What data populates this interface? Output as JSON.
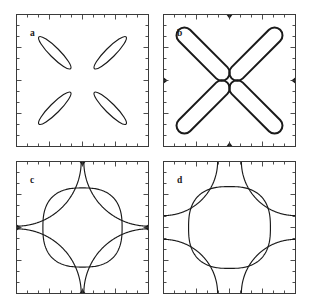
{
  "figure": {
    "background": "#ffffff",
    "line_color": "#1a1a1a",
    "frame_color": "#3a3a3a",
    "layout": "2x2 grid of square panels"
  },
  "panels": [
    {
      "id": "a",
      "label": "a",
      "position": "top-left",
      "x": 16,
      "y": 14,
      "size": 133,
      "description": "four thin elongated elliptical pockets arranged with four-fold symmetry",
      "feature_count": 4,
      "has_cusps": false
    },
    {
      "id": "b",
      "label": "b",
      "position": "top-right",
      "x": 163,
      "y": 14,
      "size": 133,
      "description": "four large rounded stadium contours forming a diamond, nearly touching at the vertices with thickened dark ends",
      "feature_count": 4,
      "has_cusps": true
    },
    {
      "id": "c",
      "label": "c",
      "position": "bottom-left",
      "x": 16,
      "y": 161,
      "size": 133,
      "description": "central rounded diamond plus four corner arcs pinching to dark cusps at the edge midpoints",
      "feature_count": 5,
      "has_cusps": true
    },
    {
      "id": "d",
      "label": "d",
      "position": "bottom-right",
      "x": 163,
      "y": 161,
      "size": 133,
      "description": "central rounded diamond plus four smaller corner arcs that do not reach the edge midpoints",
      "feature_count": 5,
      "has_cusps": false
    }
  ],
  "axes": {
    "ticks_direction": "inward",
    "minor_ticks_per_side": 12,
    "major_tick_positions": [
      0.25,
      0.5,
      0.75
    ],
    "minor_tick_length": 3,
    "major_tick_length": 5,
    "tick_labels": [],
    "axis_labels": []
  },
  "chart_data": {
    "type": "line",
    "xlabel": "",
    "ylabel": "",
    "xlim": [
      -1,
      1
    ],
    "ylim": [
      -1,
      1
    ],
    "grid": false,
    "legend": null,
    "panels": [
      {
        "name": "a",
        "series": [
          {
            "name": "pocket-upper-left",
            "shape": "ellipse",
            "cx": -0.42,
            "cy": 0.42,
            "rx": 0.34,
            "ry": 0.075,
            "rotation_deg": -45
          },
          {
            "name": "pocket-upper-right",
            "shape": "ellipse",
            "cx": 0.42,
            "cy": 0.42,
            "rx": 0.34,
            "ry": 0.075,
            "rotation_deg": 45
          },
          {
            "name": "pocket-lower-left",
            "shape": "ellipse",
            "cx": -0.42,
            "cy": -0.42,
            "rx": 0.34,
            "ry": 0.075,
            "rotation_deg": 45
          },
          {
            "name": "pocket-lower-right",
            "shape": "ellipse",
            "cx": 0.42,
            "cy": -0.42,
            "rx": 0.34,
            "ry": 0.075,
            "rotation_deg": -45
          }
        ]
      },
      {
        "name": "b",
        "series": [
          {
            "name": "stadium-upper-left",
            "shape": "stadium",
            "cx": -0.4,
            "cy": 0.4,
            "half_length": 0.52,
            "half_width": 0.12,
            "rotation_deg": -45
          },
          {
            "name": "stadium-upper-right",
            "shape": "stadium",
            "cx": 0.4,
            "cy": 0.4,
            "half_length": 0.52,
            "half_width": 0.12,
            "rotation_deg": 45
          },
          {
            "name": "stadium-lower-left",
            "shape": "stadium",
            "cx": -0.4,
            "cy": -0.4,
            "half_length": 0.52,
            "half_width": 0.12,
            "rotation_deg": 45
          },
          {
            "name": "stadium-lower-right",
            "shape": "stadium",
            "cx": 0.4,
            "cy": -0.4,
            "half_length": 0.52,
            "half_width": 0.12,
            "rotation_deg": -45
          }
        ],
        "cusp_points": [
          [
            0,
            1
          ],
          [
            0,
            -1
          ],
          [
            -1,
            0
          ],
          [
            1,
            0
          ]
        ]
      },
      {
        "name": "c",
        "series": [
          {
            "name": "central-squircle",
            "shape": "squircle",
            "cx": 0,
            "cy": 0,
            "radius": 0.6,
            "exponent": 2.6
          },
          {
            "name": "corner-arc-top-left",
            "shape": "corner-arc",
            "corner": [
              -1,
              1
            ],
            "radius": 0.98
          },
          {
            "name": "corner-arc-top-right",
            "shape": "corner-arc",
            "corner": [
              1,
              1
            ],
            "radius": 0.98
          },
          {
            "name": "corner-arc-bottom-left",
            "shape": "corner-arc",
            "corner": [
              -1,
              -1
            ],
            "radius": 0.98
          },
          {
            "name": "corner-arc-bottom-right",
            "shape": "corner-arc",
            "corner": [
              1,
              -1
            ],
            "radius": 0.98
          }
        ],
        "cusp_points": [
          [
            0,
            1
          ],
          [
            0,
            -1
          ],
          [
            -1,
            0
          ],
          [
            1,
            0
          ]
        ]
      },
      {
        "name": "d",
        "series": [
          {
            "name": "central-squircle",
            "shape": "squircle",
            "cx": 0,
            "cy": 0,
            "radius": 0.62,
            "exponent": 2.6
          },
          {
            "name": "corner-arc-top-left",
            "shape": "corner-arc",
            "corner": [
              -1,
              1
            ],
            "radius": 0.82
          },
          {
            "name": "corner-arc-top-right",
            "shape": "corner-arc",
            "corner": [
              1,
              1
            ],
            "radius": 0.82
          },
          {
            "name": "corner-arc-bottom-left",
            "shape": "corner-arc",
            "corner": [
              -1,
              -1
            ],
            "radius": 0.82
          },
          {
            "name": "corner-arc-bottom-right",
            "shape": "corner-arc",
            "corner": [
              1,
              -1
            ],
            "radius": 0.82
          }
        ],
        "cusp_points": []
      }
    ]
  }
}
